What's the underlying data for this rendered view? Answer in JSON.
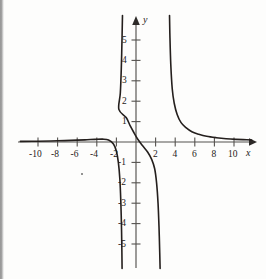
{
  "figure": {
    "background_color": "#fdfdfc",
    "curve_color": "#241f1d",
    "axis_color": "#55524f"
  },
  "axes": {
    "x_name": "x",
    "y_name": "y",
    "x_label_positions": {
      "left_px": 246,
      "top_px": 148
    },
    "y_label_positions": {
      "left_px": 143,
      "top_px": 15
    }
  },
  "chart_data": {
    "type": "line",
    "title": "",
    "subtitle": "",
    "xlabel": "x",
    "ylabel": "y",
    "xlim": [
      -11.8,
      11.8
    ],
    "ylim": [
      -6.2,
      6.2
    ],
    "grid": false,
    "legend": "none",
    "x_ticks": [
      -10,
      -8,
      -6,
      -4,
      -2,
      2,
      4,
      6,
      8,
      10
    ],
    "x_tick_labels": [
      "-10",
      "-8",
      "-6",
      "-4",
      "-2",
      "2",
      "4",
      "6",
      "8",
      "10"
    ],
    "y_ticks": [
      -5,
      -4,
      -3,
      -2,
      -1,
      1,
      2,
      3,
      4,
      5
    ],
    "y_tick_labels": [
      "-5",
      "-4",
      "-3",
      "-2",
      "-1",
      "1",
      "2",
      "3",
      "4",
      "5"
    ],
    "vertical_asymptotes": [
      -1.4,
      3.6
    ],
    "horizontal_asymptote": 0,
    "branches": [
      {
        "name": "left-branch",
        "description": "Comes in from the far left just above y = 0, hugs the x-axis, then plunges down to -infinity at the left asymptote x = -1.4",
        "x": [
          -11.8,
          -10,
          -8,
          -6,
          -5,
          -4.2,
          -3.4,
          -2.8,
          -2.3,
          -2.0,
          -1.8,
          -1.65,
          -1.55,
          -1.48,
          -1.44,
          -1.42
        ],
        "y": [
          0.03,
          0.04,
          0.06,
          0.09,
          0.11,
          0.13,
          0.14,
          0.1,
          -0.1,
          -0.45,
          -1.0,
          -1.8,
          -2.9,
          -4.2,
          -5.4,
          -6.2
        ]
      },
      {
        "name": "middle-branch",
        "description": "Descending S-shaped branch between the two asymptotes, from +infinity at x = -1.4 down through the origin region to -infinity at x = 3.6",
        "x": [
          -1.38,
          -1.42,
          -1.5,
          -1.6,
          -1.75,
          -1.0,
          -0.6,
          -0.2,
          0.2,
          0.7,
          1.2,
          1.6,
          1.9,
          2.1,
          2.25,
          2.35,
          2.42,
          2.46
        ],
        "y": [
          6.2,
          5.2,
          3.6,
          2.4,
          1.6,
          1.2,
          0.8,
          0.45,
          0.12,
          -0.2,
          -0.5,
          -0.85,
          -1.3,
          -2.0,
          -3.0,
          -4.2,
          -5.4,
          -6.2
        ]
      },
      {
        "name": "right-branch",
        "description": "Comes down from +infinity at the right asymptote x = 3.6 and flattens out toward y = 0 as x increases",
        "x": [
          3.42,
          3.46,
          3.55,
          3.7,
          3.9,
          4.2,
          4.6,
          5.1,
          5.7,
          6.4,
          7.2,
          8.2,
          9.2,
          10.2,
          11.3,
          11.8
        ],
        "y": [
          6.2,
          5.2,
          3.8,
          2.6,
          1.9,
          1.35,
          0.95,
          0.7,
          0.5,
          0.38,
          0.28,
          0.21,
          0.16,
          0.13,
          0.11,
          0.1
        ]
      }
    ]
  }
}
